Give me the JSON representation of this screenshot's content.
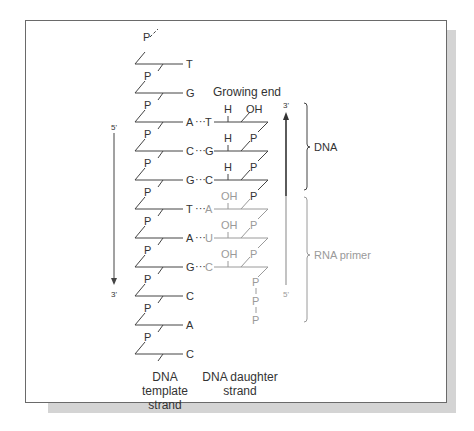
{
  "figure": {
    "growing_end": "Growing end",
    "template_caption_1": "DNA template",
    "template_caption_2": "strand",
    "daughter_caption_1": "DNA daughter",
    "daughter_caption_2": "strand",
    "bracket_dna": "DNA",
    "bracket_rna": "RNA primer",
    "left_arrow_top": "5'",
    "left_arrow_bottom": "3'",
    "right_arrow_top": "3'",
    "right_arrow_bottom": "5'",
    "phosphate": "P",
    "hydrogen": "H",
    "hydroxyl": "OH",
    "template_bases": [
      "T",
      "G",
      "A",
      "C",
      "G",
      "T",
      "A",
      "G",
      "C",
      "A",
      "C"
    ],
    "daughter_bases": [
      "",
      "",
      "T",
      "G",
      "C",
      "A",
      "U",
      "C",
      "",
      "",
      ""
    ],
    "daughter_top": [
      "",
      "",
      "H",
      "H",
      "H",
      "OH",
      "OH",
      "OH",
      "",
      "",
      ""
    ],
    "daughter_right": [
      "",
      "",
      "OH",
      "P",
      "P",
      "P",
      "P",
      "P",
      "",
      "",
      ""
    ],
    "triphosphate": [
      "P",
      "P",
      "P"
    ],
    "colors": {
      "dna": "#333333",
      "rna": "#9a9a9a",
      "frame": "#6a6a6a",
      "shadow": "#d4d4d4"
    }
  }
}
